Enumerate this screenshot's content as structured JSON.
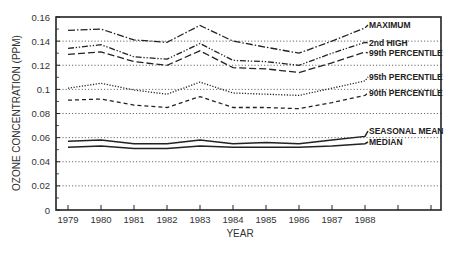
{
  "chart_data": {
    "type": "line",
    "title": "",
    "xlabel": "YEAR",
    "ylabel": "OZONE CONCENTRATION (PPM)",
    "x": [
      1979,
      1980,
      1981,
      1982,
      1983,
      1984,
      1985,
      1986,
      1987,
      1988
    ],
    "x_tick_labels": [
      "1979",
      "1980",
      "1981",
      "1982",
      "1983",
      "1984",
      "1985",
      "1986",
      "1987",
      "1988"
    ],
    "extra_unlabeled_ticks": 2,
    "y_ticks": [
      0,
      0.02,
      0.04,
      0.06,
      0.08,
      0.1,
      0.12,
      0.14,
      0.16
    ],
    "y_tick_labels": [
      "0",
      "0.02",
      "0.04",
      "0.06",
      "0.08",
      "0.1",
      "0.12",
      "0.14",
      "0.16"
    ],
    "ylim": [
      0,
      0.16
    ],
    "grid": "horizontal dotted",
    "legend_position": "inline labels at right end of lines",
    "series": [
      {
        "name": "MAXIMUM",
        "style": "dash-dot",
        "values": [
          0.149,
          0.15,
          0.141,
          0.139,
          0.153,
          0.14,
          0.135,
          0.13,
          0.14,
          0.151
        ]
      },
      {
        "name": "2nd HIGH",
        "style": "dash-dot-dot",
        "values": [
          0.134,
          0.137,
          0.127,
          0.125,
          0.138,
          0.124,
          0.123,
          0.12,
          0.13,
          0.139
        ]
      },
      {
        "name": "99th PERCENTILE",
        "style": "long-dash",
        "values": [
          0.129,
          0.131,
          0.123,
          0.12,
          0.132,
          0.118,
          0.117,
          0.114,
          0.122,
          0.131
        ]
      },
      {
        "name": "95th PERCENTILE",
        "style": "dotted",
        "values": [
          0.101,
          0.105,
          0.0995,
          0.096,
          0.106,
          0.097,
          0.096,
          0.095,
          0.101,
          0.107
        ]
      },
      {
        "name": "90th PERCENTILE",
        "style": "short-dash",
        "values": [
          0.091,
          0.092,
          0.087,
          0.085,
          0.094,
          0.085,
          0.085,
          0.084,
          0.089,
          0.095
        ]
      },
      {
        "name": "SEASONAL MEAN",
        "style": "solid",
        "values": [
          0.057,
          0.058,
          0.055,
          0.055,
          0.058,
          0.055,
          0.056,
          0.055,
          0.058,
          0.061
        ]
      },
      {
        "name": "MEDIAN",
        "style": "solid",
        "values": [
          0.052,
          0.053,
          0.051,
          0.051,
          0.053,
          0.052,
          0.052,
          0.052,
          0.053,
          0.055
        ]
      }
    ]
  },
  "labels": {
    "xlabel": "YEAR",
    "ylabel": "OZONE CONCENTRATION (PPM)",
    "series": [
      "MAXIMUM",
      "2nd HIGH",
      "99th PERCENTILE",
      "95th PERCENTILE",
      "90th PERCENTILE",
      "SEASONAL MEAN",
      "MEDIAN"
    ]
  }
}
